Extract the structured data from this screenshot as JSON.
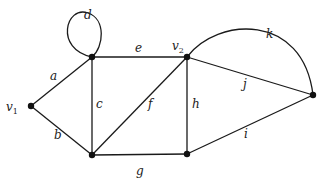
{
  "diagram": {
    "type": "graph",
    "colors": {
      "edge": "#1a1a1a",
      "vertex": "#111111",
      "label": "#222222"
    },
    "vertices": [
      {
        "id": "v1",
        "x": 31,
        "y": 106,
        "label": "v",
        "sub": "1",
        "lx": 6,
        "ly": 111
      },
      {
        "id": "TL",
        "x": 92,
        "y": 57,
        "label": "",
        "sub": ""
      },
      {
        "id": "v2",
        "x": 187,
        "y": 57,
        "label": "v",
        "sub": "2",
        "lx": 172,
        "ly": 50
      },
      {
        "id": "BL",
        "x": 92,
        "y": 155,
        "label": "",
        "sub": ""
      },
      {
        "id": "BR",
        "x": 187,
        "y": 154,
        "label": "",
        "sub": ""
      },
      {
        "id": "R",
        "x": 313,
        "y": 95,
        "label": "",
        "sub": ""
      }
    ],
    "edges": [
      {
        "label": "a",
        "from": "v1",
        "to": "TL",
        "kind": "line",
        "lx": 50,
        "ly": 80
      },
      {
        "label": "b",
        "from": "v1",
        "to": "BL",
        "kind": "line",
        "lx": 54,
        "ly": 139
      },
      {
        "label": "c",
        "from": "TL",
        "to": "BL",
        "kind": "line",
        "lx": 96,
        "ly": 108
      },
      {
        "label": "d",
        "from": "TL",
        "to": "TL",
        "kind": "loop",
        "lx": 84,
        "ly": 19
      },
      {
        "label": "e",
        "from": "TL",
        "to": "v2",
        "kind": "line",
        "lx": 135,
        "ly": 52
      },
      {
        "label": "f",
        "from": "BL",
        "to": "v2",
        "kind": "line",
        "lx": 148,
        "ly": 108
      },
      {
        "label": "g",
        "from": "BL",
        "to": "BR",
        "kind": "line",
        "lx": 136,
        "ly": 175
      },
      {
        "label": "h",
        "from": "v2",
        "to": "BR",
        "kind": "line",
        "lx": 192,
        "ly": 108
      },
      {
        "label": "i",
        "from": "BR",
        "to": "R",
        "kind": "line",
        "lx": 244,
        "ly": 138
      },
      {
        "label": "j",
        "from": "v2",
        "to": "R",
        "kind": "line",
        "lx": 243,
        "ly": 88
      },
      {
        "label": "k",
        "from": "v2",
        "to": "R",
        "kind": "arc",
        "lx": 266,
        "ly": 38
      }
    ]
  }
}
